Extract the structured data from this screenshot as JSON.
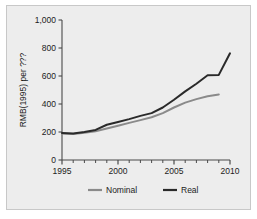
{
  "figure": {
    "background_color": "#ffffff",
    "panel_color": "#ededed",
    "panel_border_color": "#c8c8c8",
    "axis_color": "#4a4a4a",
    "text_color": "#1c1c1c"
  },
  "chart_data": {
    "type": "line",
    "title": "",
    "subtitle": "",
    "xlabel": "",
    "ylabel": "RMB(1995) per ???",
    "xlim": [
      1995,
      2010
    ],
    "ylim": [
      0,
      1000
    ],
    "grid": false,
    "legend_position": "bottom",
    "xticks": [
      1995,
      2000,
      2005,
      2010
    ],
    "xtick_labels": [
      "1995",
      "2000",
      "2005",
      "2010"
    ],
    "xminor_ticks": [
      1996,
      1997,
      1998,
      1999,
      2001,
      2002,
      2003,
      2004,
      2006,
      2007,
      2008,
      2009
    ],
    "yticks": [
      0,
      200,
      400,
      600,
      800,
      1000
    ],
    "ytick_labels": [
      "0",
      "200",
      "400",
      "600",
      "800",
      "1,000"
    ],
    "x": [
      1995,
      1996,
      1997,
      1998,
      1999,
      2000,
      2001,
      2002,
      2003,
      2004,
      2005,
      2006,
      2007,
      2008,
      2009,
      2010
    ],
    "series": [
      {
        "name": "Nominal",
        "color": "#8a8a8a",
        "values": [
          190,
          185,
          195,
          205,
          225,
          245,
          265,
          285,
          305,
          335,
          375,
          410,
          435,
          455,
          468,
          null
        ]
      },
      {
        "name": "Real",
        "color": "#2a2a2a",
        "values": [
          192,
          190,
          200,
          215,
          252,
          272,
          292,
          315,
          335,
          375,
          430,
          490,
          545,
          605,
          608,
          762
        ]
      }
    ],
    "legend": [
      {
        "label": "Nominal",
        "color": "#8a8a8a"
      },
      {
        "label": "Real",
        "color": "#2a2a2a"
      }
    ]
  }
}
